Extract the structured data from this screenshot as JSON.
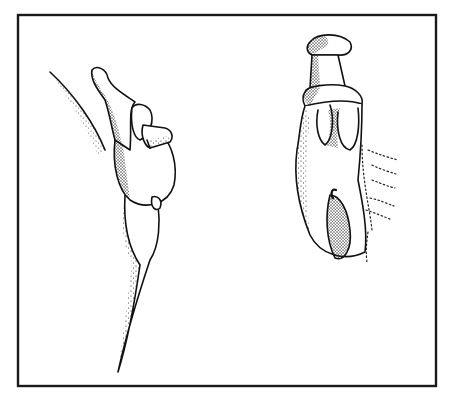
{
  "illustration": {
    "subject": "anatomical line drawings with stipple shading",
    "figures": [
      {
        "name": "left-figure",
        "description": "lateral view with curved body outline and protruding bony process"
      },
      {
        "name": "right-figure",
        "description": "frontal view of articulated bony segments with tissue lines"
      }
    ],
    "colors": {
      "ink": "#111111",
      "paper": "#ffffff"
    }
  }
}
